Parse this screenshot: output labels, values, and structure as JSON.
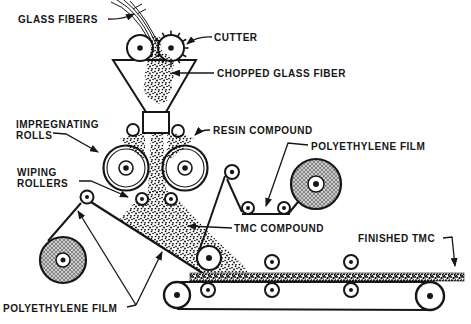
{
  "diagram": {
    "labels": {
      "glass_fibers": "GLASS FIBERS",
      "cutter": "CUTTER",
      "chopped_glass_fiber": "CHOPPED GLASS FIBER",
      "impregnating_rolls": [
        "IMPREGNATING",
        "ROLLS"
      ],
      "resin_compound": "RESIN COMPOUND",
      "polyethylene_film_top": "POLYETHYLENE FILM",
      "wiping_rollers": [
        "WIPING",
        "ROLLERS"
      ],
      "tmc_compound": "TMC COMPOUND",
      "finished_tmc": "FINISHED TMC",
      "polyethylene_film_bottom": "POLYETHYLENE FILM"
    },
    "colors": {
      "ink": "#161616",
      "background": "#ffffff",
      "roll_hatch_base": "#cbcbcb",
      "roll_hatch_line": "#565656"
    }
  }
}
